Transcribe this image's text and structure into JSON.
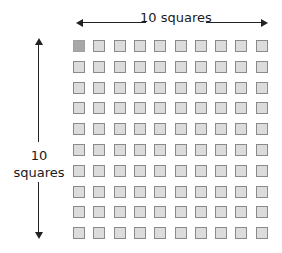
{
  "diagram": {
    "horizontal_label": "10 squares",
    "vertical_label_line1": "10",
    "vertical_label_line2": "squares",
    "rows": 10,
    "cols": 10,
    "highlighted_cell": {
      "row": 0,
      "col": 0
    },
    "colors": {
      "square_fill": "#dcdcdc",
      "square_border": "#8a8a8a",
      "highlight_fill": "#a8a8a8",
      "arrow": "#222222"
    }
  }
}
